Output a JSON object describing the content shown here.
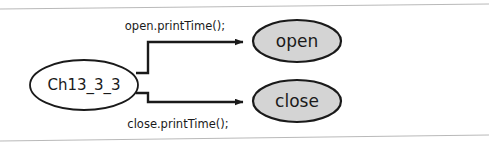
{
  "diagram": {
    "type": "call-graph",
    "background_color": "#ffffff",
    "frame": {
      "name": "scanned-page-border",
      "top_line": {
        "x1": 0,
        "y1": 9,
        "x2": 489,
        "y2": 4
      },
      "bottom_line": {
        "x1": 0,
        "y1": 141,
        "x2": 489,
        "y2": 135
      },
      "color": "#b9b9b9"
    },
    "nodes": [
      {
        "id": "source",
        "label": "Ch13_3_3",
        "shape": "ellipse",
        "cx": 84,
        "cy": 85,
        "rx": 54,
        "ry": 25,
        "fill": "#ffffff",
        "stroke": "#1a1a1a",
        "font_size": 15
      },
      {
        "id": "open",
        "label": "open",
        "shape": "ellipse",
        "cx": 297,
        "cy": 41,
        "rx": 44,
        "ry": 21,
        "fill": "#d4d4d4",
        "stroke": "#1a1a1a",
        "font_size": 17
      },
      {
        "id": "close",
        "label": "close",
        "shape": "ellipse",
        "cx": 297,
        "cy": 101,
        "rx": 44,
        "ry": 21,
        "fill": "#d4d4d4",
        "stroke": "#1a1a1a",
        "font_size": 17
      }
    ],
    "edges": [
      {
        "id": "edge-open",
        "from": "source",
        "to": "open",
        "label": "open.printTime();",
        "label_x": 175,
        "label_y": 30,
        "font_size": 11,
        "path": "M 136 73 L 148 73 L 148 42 L 240 42",
        "arrow_tip_x": 252,
        "arrow_tip_y": 42,
        "stroke": "#1a1a1a"
      },
      {
        "id": "edge-close",
        "from": "source",
        "to": "close",
        "label": "close.printTime();",
        "label_x": 178,
        "label_y": 127,
        "font_size": 11,
        "path": "M 136 93 L 148 93 L 148 102 L 240 102",
        "arrow_tip_x": 252,
        "arrow_tip_y": 102,
        "stroke": "#1a1a1a"
      }
    ]
  }
}
